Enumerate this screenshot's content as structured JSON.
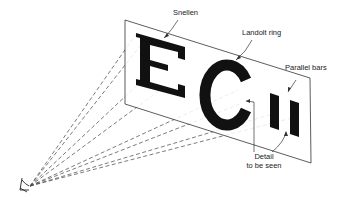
{
  "diagram": {
    "labels": {
      "snellen": "Snellen",
      "landolt": "Landolt ring",
      "parallel": "Parallel bars",
      "detail_line1": "Detail",
      "detail_line2": "to be seen"
    },
    "colors": {
      "ink": "#111111",
      "line": "#333333",
      "background": "#ffffff"
    }
  }
}
